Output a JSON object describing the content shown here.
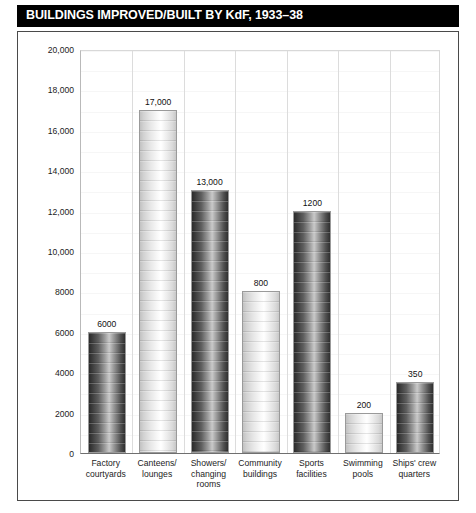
{
  "title": "BUILDINGS IMPROVED/BUILT BY KdF, 1933–38",
  "colors": {
    "title_bar_background": "#000000",
    "title_text": "#ffffff",
    "frame_border": "#4a4a4a",
    "axis_text": "#1c1c1c",
    "gridline": "#ededed",
    "bar_dark": "#2b2b2b",
    "bar_light": "#e8e8e8"
  },
  "chart_data": {
    "type": "bar",
    "title": "BUILDINGS IMPROVED/BUILT BY KdF, 1933–38",
    "xlabel": "",
    "ylabel": "",
    "ylim": [
      0,
      20000
    ],
    "grid": true,
    "legend": "none",
    "ytick_labels": [
      "20,000",
      "18,000",
      "16,000",
      "14,000",
      "12,000",
      "10,000",
      "8000",
      "6000",
      "4000",
      "2000",
      "0"
    ],
    "ytick_values": [
      20000,
      18000,
      16000,
      14000,
      12000,
      10000,
      8000,
      6000,
      4000,
      2000,
      0
    ],
    "categories": [
      "Factory courtyards",
      "Canteens/ lounges",
      "Showers/ changing rooms",
      "Community buildings",
      "Sports facilities",
      "Swimming pools",
      "Ships' crew quarters"
    ],
    "values": [
      6000,
      17000,
      13000,
      8000,
      12000,
      2000,
      3500
    ],
    "data_labels": [
      "6000",
      "17,000",
      "13,000",
      "800",
      "1200",
      "200",
      "350"
    ],
    "bar_shading": [
      "dark",
      "light",
      "dark",
      "light",
      "dark",
      "light",
      "dark"
    ]
  },
  "bars": [
    {
      "category_lines": [
        "Factory",
        "courtyards"
      ],
      "label": "6000",
      "value": 6000,
      "shade": "dark"
    },
    {
      "category_lines": [
        "Canteens/",
        "lounges"
      ],
      "label": "17,000",
      "value": 17000,
      "shade": "light"
    },
    {
      "category_lines": [
        "Showers/",
        "changing",
        "rooms"
      ],
      "label": "13,000",
      "value": 13000,
      "shade": "dark"
    },
    {
      "category_lines": [
        "Community",
        "buildings"
      ],
      "label": "800",
      "value": 8000,
      "shade": "light"
    },
    {
      "category_lines": [
        "Sports",
        "facilities"
      ],
      "label": "1200",
      "value": 12000,
      "shade": "dark"
    },
    {
      "category_lines": [
        "Swimming",
        "pools"
      ],
      "label": "200",
      "value": 2000,
      "shade": "light"
    },
    {
      "category_lines": [
        "Ships' crew",
        "quarters"
      ],
      "label": "350",
      "value": 3500,
      "shade": "dark"
    }
  ]
}
